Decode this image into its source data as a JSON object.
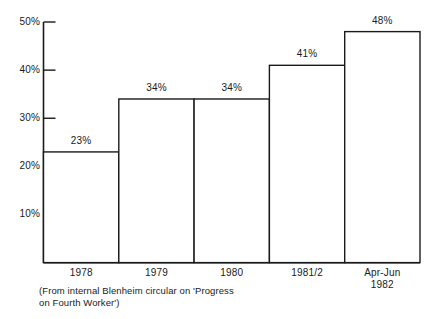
{
  "chart_data": {
    "type": "bar",
    "title": "",
    "subtitle": "",
    "xlabel": "",
    "ylabel": "",
    "categories": [
      "1978",
      "1979",
      "1980",
      "1981/2",
      "Apr-Jun\n1982"
    ],
    "values": [
      23,
      34,
      34,
      41,
      48
    ],
    "data_labels": [
      "23%",
      "34%",
      "34%",
      "41%",
      "48%"
    ],
    "ylim": [
      0,
      50
    ],
    "yticks": [
      10,
      20,
      30,
      40,
      50
    ],
    "ytick_labels": [
      "10%",
      "20%",
      "30%",
      "40%",
      "50%"
    ],
    "grid": false,
    "legend": null,
    "bar_style": "stepped-outline-adjacent",
    "colors": {
      "background": "#ffffff",
      "bar_fill": "#ffffff",
      "bar_outline": "#1a1a1a",
      "axis": "#1a1a1a",
      "text": "#1a1a1a"
    }
  },
  "caption": {
    "text": "(From internal Blenheim circular on 'Progress\non Fourth Worker')"
  }
}
